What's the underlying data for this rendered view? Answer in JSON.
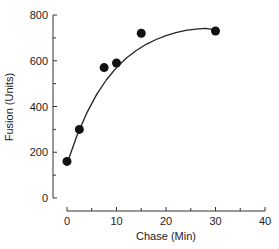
{
  "chart_data": {
    "type": "scatter",
    "title": "",
    "xlabel": "Chase (Min)",
    "ylabel": "Fusion (Units)",
    "xlim": [
      0,
      40
    ],
    "ylim": [
      0,
      800
    ],
    "x_ticks": [
      0,
      10,
      20,
      30,
      40
    ],
    "x_minor_ticks": [
      5,
      15,
      25,
      35
    ],
    "y_ticks": [
      0,
      200,
      400,
      600,
      800
    ],
    "y_minor_ticks": [
      100,
      300,
      500,
      700
    ],
    "grid": false,
    "legend": null,
    "series": [
      {
        "name": "Fusion",
        "marker": "filled-circle",
        "x": [
          0,
          2.5,
          7.5,
          10,
          15,
          30
        ],
        "y": [
          160,
          300,
          570,
          590,
          720,
          730
        ]
      }
    ],
    "fit_curve": {
      "type": "exponential-saturation",
      "description": "smooth fitted curve rising from ~150 at 0 min to plateau ~735",
      "x": [
        0,
        2,
        4,
        6,
        8,
        10,
        12,
        14,
        16,
        18,
        20,
        22,
        24,
        26,
        28,
        30
      ],
      "y": [
        150,
        272,
        372,
        453,
        518,
        570,
        612,
        645,
        672,
        693,
        710,
        723,
        733,
        738,
        742,
        735
      ]
    }
  },
  "axes": {
    "x_title": "Chase (Min)",
    "y_title": "Fusion (Units)",
    "x_tick_labels": [
      "0",
      "10",
      "20",
      "30",
      "40"
    ],
    "y_tick_labels": [
      "0",
      "200",
      "400",
      "600",
      "800"
    ]
  },
  "colors": {
    "ink": "#111111",
    "axis": "#333333",
    "background": "#ffffff"
  }
}
